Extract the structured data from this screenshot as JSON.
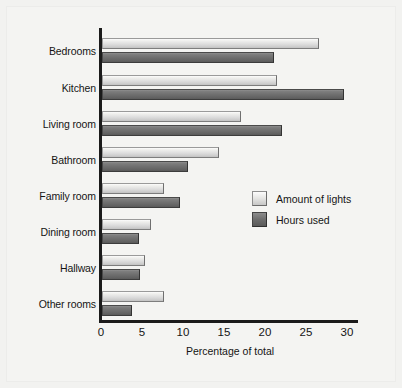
{
  "chart_data": {
    "type": "bar",
    "orientation": "horizontal",
    "title": "",
    "xlabel": "Percentage of total",
    "ylabel": "",
    "xlim": [
      0,
      30
    ],
    "xticks": [
      0,
      5,
      10,
      15,
      20,
      25,
      30
    ],
    "grid": false,
    "legend_position": "center-right",
    "categories": [
      "Bedrooms",
      "Kitchen",
      "Living room",
      "Bathroom",
      "Family room",
      "Dining room",
      "Hallway",
      "Other rooms"
    ],
    "series": [
      {
        "name": "Amount of lights",
        "color": "#dedede",
        "values": [
          26.5,
          21.3,
          17.0,
          14.3,
          7.5,
          6.0,
          5.3,
          7.5
        ]
      },
      {
        "name": "Hours used",
        "color": "#6d6d6d",
        "values": [
          21.0,
          29.5,
          22.0,
          10.5,
          9.5,
          4.5,
          4.6,
          3.7
        ]
      }
    ]
  },
  "legend": {
    "entries": [
      {
        "label": "Amount of lights",
        "swatch": "light"
      },
      {
        "label": "Hours used",
        "swatch": "dark"
      }
    ]
  },
  "axis": {
    "x_title": "Percentage of total",
    "x_tick_labels": [
      "0",
      "5",
      "10",
      "15",
      "20",
      "25",
      "30"
    ]
  },
  "colors": {
    "background": "#f2f2f0",
    "axis": "#1b1b1b",
    "text": "#141414",
    "series_light": "#dedede",
    "series_dark": "#6d6d6d"
  }
}
